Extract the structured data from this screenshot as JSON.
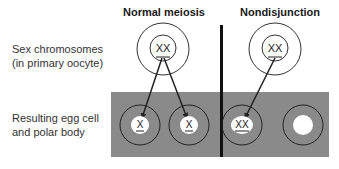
{
  "headings": {
    "normal": "Normal meiosis",
    "nondisjunction": "Nondisjunction"
  },
  "labels": {
    "top_line1": "Sex chromosomes",
    "top_line2": "(in primary oocyte)",
    "bottom_line1": "Resulting egg cell",
    "bottom_line2": "and polar body"
  },
  "cells": {
    "normal_primary": "XX",
    "nondisjunction_primary": "XX",
    "normal_egg": "X",
    "normal_polar": "X",
    "nondisjunction_egg": "XX",
    "nondisjunction_polar": ""
  },
  "colors": {
    "band": "#8a8a8a",
    "divider": "#111111",
    "line": "#222222",
    "nucleus": "#ffffff"
  }
}
